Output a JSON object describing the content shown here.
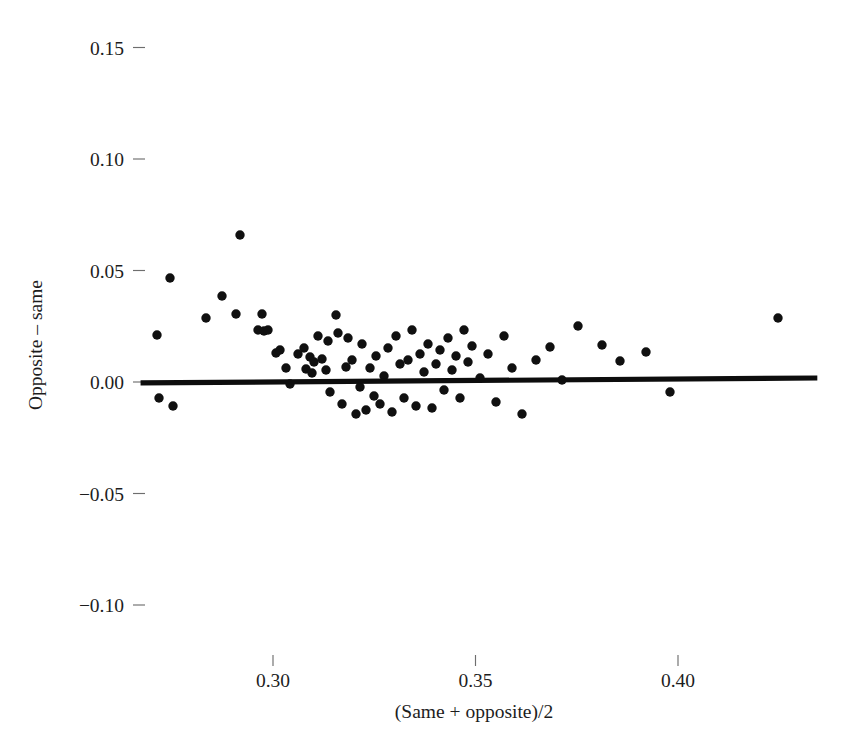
{
  "chart_data": {
    "type": "scatter",
    "title": "",
    "subtitle": "",
    "xlabel": "(Same + opposite)/2",
    "ylabel": "Opposite – same",
    "xlim": [
      0.268,
      0.437
    ],
    "ylim": [
      -0.122,
      0.162
    ],
    "xticks": [
      0.3,
      0.35,
      0.4
    ],
    "xtick_labels": [
      "0.30",
      "0.35",
      "0.40"
    ],
    "yticks": [
      -0.1,
      -0.05,
      0.0,
      0.05,
      0.1,
      0.15
    ],
    "ytick_labels": [
      "−0.10",
      "−0.05",
      "0.00",
      "0.05",
      "0.10",
      "0.15"
    ],
    "grid": false,
    "legend": null,
    "marker": {
      "shape": "circle",
      "color": "#101010",
      "size": 9
    },
    "reference_line": {
      "type": "linear-fit",
      "color": "#0d0d0d",
      "width": 5,
      "x_start": 0.2673,
      "y_start": -0.0004,
      "x_end": 0.4344,
      "y_end": 0.0018
    },
    "n_points": 79,
    "points": [
      {
        "x": 0.2732,
        "y": 0.0211
      },
      {
        "x": 0.2747,
        "y": -0.0036
      },
      {
        "x": 0.2776,
        "y": 0.0395
      },
      {
        "x": 0.2791,
        "y": -0.0067
      },
      {
        "x": 0.2874,
        "y": 0.0287
      },
      {
        "x": 0.2913,
        "y": 0.0364
      },
      {
        "x": 0.2947,
        "y": 0.0301
      },
      {
        "x": 0.2957,
        "y": 0.0619
      },
      {
        "x": 0.3001,
        "y": 0.0233
      },
      {
        "x": 0.3011,
        "y": 0.0296
      },
      {
        "x": 0.3016,
        "y": 0.0229
      },
      {
        "x": 0.3026,
        "y": 0.0233
      },
      {
        "x": 0.3045,
        "y": 0.013
      },
      {
        "x": 0.3055,
        "y": 0.0139
      },
      {
        "x": 0.307,
        "y": 0.0063
      },
      {
        "x": 0.308,
        "y": -0.0013
      },
      {
        "x": 0.3099,
        "y": 0.0126
      },
      {
        "x": 0.3114,
        "y": 0.0148
      },
      {
        "x": 0.3119,
        "y": 0.0058
      },
      {
        "x": 0.3129,
        "y": 0.0117
      },
      {
        "x": 0.3134,
        "y": 0.004
      },
      {
        "x": 0.3139,
        "y": 0.0081
      },
      {
        "x": 0.3148,
        "y": 0.0184
      },
      {
        "x": 0.3158,
        "y": 0.0099
      },
      {
        "x": 0.3168,
        "y": 0.0049
      },
      {
        "x": 0.3173,
        "y": 0.0166
      },
      {
        "x": 0.3178,
        "y": -0.0031
      },
      {
        "x": 0.3192,
        "y": 0.0206
      },
      {
        "x": 0.3197,
        "y": 0.0135
      },
      {
        "x": 0.3207,
        "y": -0.0076
      },
      {
        "x": 0.3217,
        "y": 0.0067
      },
      {
        "x": 0.3222,
        "y": 0.0175
      },
      {
        "x": 0.3232,
        "y": 0.009
      },
      {
        "x": 0.3241,
        "y": -0.0121
      },
      {
        "x": 0.3251,
        "y": -0.0013
      },
      {
        "x": 0.3256,
        "y": 0.0157
      },
      {
        "x": 0.3266,
        "y": -0.0094
      },
      {
        "x": 0.3276,
        "y": 0.0063
      },
      {
        "x": 0.3285,
        "y": -0.0049
      },
      {
        "x": 0.329,
        "y": 0.0117
      },
      {
        "x": 0.33,
        "y": -0.0085
      },
      {
        "x": 0.331,
        "y": 0.0022
      },
      {
        "x": 0.332,
        "y": 0.0148
      },
      {
        "x": 0.333,
        "y": -0.0112
      },
      {
        "x": 0.3339,
        "y": 0.0184
      },
      {
        "x": 0.3349,
        "y": 0.0072
      },
      {
        "x": 0.3359,
        "y": -0.0036
      },
      {
        "x": 0.3369,
        "y": 0.0099
      },
      {
        "x": 0.3379,
        "y": 0.0211
      },
      {
        "x": 0.3388,
        "y": -0.0067
      },
      {
        "x": 0.3398,
        "y": 0.0126
      },
      {
        "x": 0.3408,
        "y": 0.0045
      },
      {
        "x": 0.3418,
        "y": 0.017
      },
      {
        "x": 0.3427,
        "y": -0.0103
      },
      {
        "x": 0.3437,
        "y": 0.0081
      },
      {
        "x": 0.3447,
        "y": 0.0139
      },
      {
        "x": 0.3457,
        "y": -0.0022
      },
      {
        "x": 0.3467,
        "y": 0.0197
      },
      {
        "x": 0.3476,
        "y": 0.0054
      },
      {
        "x": 0.3486,
        "y": 0.0112
      },
      {
        "x": 0.3496,
        "y": -0.0058
      },
      {
        "x": 0.3506,
        "y": 0.0233
      },
      {
        "x": 0.3515,
        "y": 0.0094
      },
      {
        "x": 0.3525,
        "y": 0.0161
      },
      {
        "x": 0.3545,
        "y": 0.0022
      },
      {
        "x": 0.3564,
        "y": 0.013
      },
      {
        "x": 0.3584,
        "y": -0.0081
      },
      {
        "x": 0.3604,
        "y": 0.0206
      },
      {
        "x": 0.3623,
        "y": 0.0067
      },
      {
        "x": 0.3648,
        "y": -0.0139
      },
      {
        "x": 0.3682,
        "y": 0.0094
      },
      {
        "x": 0.3717,
        "y": 0.0157
      },
      {
        "x": 0.3746,
        "y": 0.0018
      },
      {
        "x": 0.3785,
        "y": 0.0251
      },
      {
        "x": 0.3844,
        "y": 0.0175
      },
      {
        "x": 0.3888,
        "y": 0.0103
      },
      {
        "x": 0.3952,
        "y": 0.0139
      },
      {
        "x": 0.401,
        "y": -0.0045
      },
      {
        "x": 0.4275,
        "y": 0.0287
      }
    ],
    "pixel_points": [
      [
        157,
        335
      ],
      [
        159,
        398
      ],
      [
        170,
        278
      ],
      [
        173,
        406
      ],
      [
        206,
        318
      ],
      [
        222,
        296
      ],
      [
        236,
        314
      ],
      [
        240,
        235
      ],
      [
        258,
        330
      ],
      [
        262,
        314
      ],
      [
        264,
        331
      ],
      [
        268,
        330
      ],
      [
        276,
        353
      ],
      [
        280,
        350
      ],
      [
        286,
        368
      ],
      [
        290,
        384
      ],
      [
        298,
        354
      ],
      [
        304,
        348
      ],
      [
        306,
        369
      ],
      [
        310,
        357
      ],
      [
        312,
        373
      ],
      [
        314,
        362
      ],
      [
        318,
        336
      ],
      [
        322,
        359
      ],
      [
        326,
        370
      ],
      [
        328,
        341
      ],
      [
        330,
        392
      ],
      [
        336,
        315
      ],
      [
        338,
        333
      ],
      [
        342,
        404
      ],
      [
        346,
        367
      ],
      [
        348,
        338
      ],
      [
        352,
        360
      ],
      [
        356,
        414
      ],
      [
        360,
        387
      ],
      [
        362,
        344
      ],
      [
        366,
        410
      ],
      [
        370,
        368
      ],
      [
        374,
        396
      ],
      [
        376,
        356
      ],
      [
        380,
        404
      ],
      [
        384,
        376
      ],
      [
        388,
        348
      ],
      [
        392,
        412
      ],
      [
        396,
        336
      ],
      [
        400,
        364
      ],
      [
        404,
        398
      ],
      [
        408,
        360
      ],
      [
        412,
        330
      ],
      [
        416,
        406
      ],
      [
        420,
        354
      ],
      [
        424,
        372
      ],
      [
        428,
        344
      ],
      [
        432,
        408
      ],
      [
        436,
        364
      ],
      [
        440,
        350
      ],
      [
        444,
        390
      ],
      [
        448,
        338
      ],
      [
        452,
        370
      ],
      [
        456,
        356
      ],
      [
        460,
        398
      ],
      [
        464,
        330
      ],
      [
        468,
        362
      ],
      [
        472,
        346
      ],
      [
        480,
        378
      ],
      [
        488,
        354
      ],
      [
        496,
        402
      ],
      [
        504,
        336
      ],
      [
        512,
        368
      ],
      [
        522,
        414
      ],
      [
        536,
        360
      ],
      [
        550,
        347
      ],
      [
        562,
        380
      ],
      [
        578,
        326
      ],
      [
        602,
        345
      ],
      [
        620,
        361
      ],
      [
        646,
        352
      ],
      [
        670,
        392
      ],
      [
        778,
        318
      ]
    ]
  },
  "axis": {
    "x_title": "(Same + opposite)/2",
    "y_title": "Opposite – same"
  }
}
